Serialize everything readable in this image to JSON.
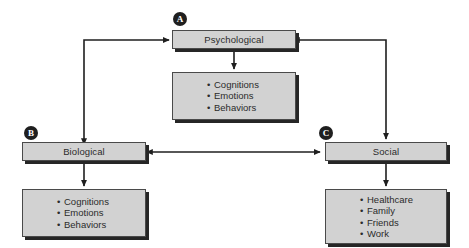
{
  "diagram": {
    "background_color": "#ffffff",
    "box_fill_color": "#d2d2d2",
    "box_border_color": "#4a4a4a",
    "shadow_color": "#262626",
    "text_color": "#2b2b2b",
    "badge_color": "#1f1f1f",
    "badge_text_color": "#ffffff"
  },
  "nodes": {
    "psychological": {
      "badge": "A",
      "label": "Psychological",
      "items": [
        "Cognitions",
        "Emotions",
        "Behaviors"
      ]
    },
    "biological": {
      "badge": "B",
      "label": "Biological",
      "items": [
        "Cognitions",
        "Emotions",
        "Behaviors"
      ]
    },
    "social": {
      "badge": "C",
      "label": "Social",
      "items": [
        "Healthcare",
        "Family",
        "Friends",
        "Work"
      ]
    }
  },
  "bullet_glyph": "•",
  "connectors": [
    {
      "name": "psychological-to-sublist",
      "from": "psychological",
      "to": "psychological-items",
      "direction": "down",
      "arrowheads": 1
    },
    {
      "name": "biological-to-sublist",
      "from": "biological",
      "to": "biological-items",
      "direction": "down",
      "arrowheads": 1
    },
    {
      "name": "social-to-sublist",
      "from": "social",
      "to": "social-items",
      "direction": "down",
      "arrowheads": 1
    },
    {
      "name": "psychological-biological-link",
      "from": "psychological",
      "to": "biological",
      "direction": "bidirectional",
      "arrowheads": 2,
      "style": "elbow-left"
    },
    {
      "name": "psychological-social-link",
      "from": "psychological",
      "to": "social",
      "direction": "bidirectional",
      "arrowheads": 2,
      "style": "elbow-right"
    },
    {
      "name": "biological-social-link",
      "from": "biological",
      "to": "social",
      "direction": "bidirectional",
      "arrowheads": 2,
      "style": "straight-horizontal"
    }
  ]
}
